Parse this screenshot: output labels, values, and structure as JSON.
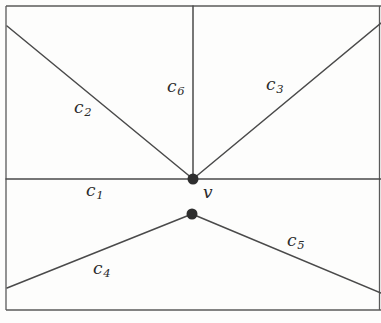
{
  "figure": {
    "width": 381,
    "height": 323,
    "background_color": "#fdfdfc",
    "stroke_color": "#4a4a4a",
    "vertex_color": "#2e2e2e",
    "label_color": "#2b2b2b"
  },
  "frame": {
    "name": "outer-rectangle",
    "left": 6,
    "top": 6,
    "right": 379,
    "bottom": 310
  },
  "vertices": [
    {
      "id": "v",
      "name": "vertex-v",
      "x": 193,
      "y": 179,
      "radius": 5.5,
      "label": "v"
    },
    {
      "id": "w",
      "name": "vertex-lower",
      "x": 192,
      "y": 214,
      "radius": 5.5,
      "label": ""
    }
  ],
  "edges": [
    {
      "id": "c1",
      "name": "edge-c1",
      "label": "c",
      "subscript": "1",
      "x1": 6,
      "y1": 179,
      "x2": 193,
      "y2": 179
    },
    {
      "id": "c1r",
      "name": "edge-c1-right-extension",
      "label": "",
      "subscript": "",
      "x1": 193,
      "y1": 179,
      "x2": 381,
      "y2": 179
    },
    {
      "id": "c2",
      "name": "edge-c2",
      "label": "c",
      "subscript": "2",
      "x1": 7,
      "y1": 26,
      "x2": 193,
      "y2": 179
    },
    {
      "id": "c3",
      "name": "edge-c3",
      "label": "c",
      "subscript": "3",
      "x1": 193,
      "y1": 179,
      "x2": 381,
      "y2": 23
    },
    {
      "id": "c6",
      "name": "edge-c6",
      "label": "c",
      "subscript": "6",
      "x1": 193,
      "y1": 6,
      "x2": 193,
      "y2": 179
    },
    {
      "id": "c4",
      "name": "edge-c4",
      "label": "c",
      "subscript": "4",
      "x1": 7,
      "y1": 288,
      "x2": 192,
      "y2": 214
    },
    {
      "id": "c5",
      "name": "edge-c5",
      "label": "c",
      "subscript": "5",
      "x1": 192,
      "y1": 214,
      "x2": 381,
      "y2": 293
    }
  ],
  "labels": [
    {
      "id": "c2",
      "name": "label-c2",
      "text": "c",
      "subscript": "2",
      "x": 74,
      "y": 99
    },
    {
      "id": "c6",
      "name": "label-c6",
      "text": "c",
      "subscript": "6",
      "x": 167,
      "y": 78
    },
    {
      "id": "c3",
      "name": "label-c3",
      "text": "c",
      "subscript": "3",
      "x": 266,
      "y": 76
    },
    {
      "id": "c1",
      "name": "label-c1",
      "text": "c",
      "subscript": "1",
      "x": 86,
      "y": 182
    },
    {
      "id": "c4",
      "name": "label-c4",
      "text": "c",
      "subscript": "4",
      "x": 93,
      "y": 260
    },
    {
      "id": "c5",
      "name": "label-c5",
      "text": "c",
      "subscript": "5",
      "x": 287,
      "y": 232
    }
  ],
  "vertex_labels": [
    {
      "id": "v",
      "name": "label-vertex-v",
      "text": "v",
      "x": 203,
      "y": 184
    }
  ]
}
